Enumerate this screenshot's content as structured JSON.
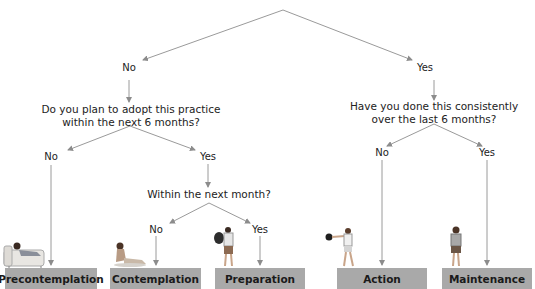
{
  "diagram": {
    "type": "decision-tree",
    "root_branches": {
      "left": "No",
      "right": "Yes"
    },
    "questions": {
      "plan_6_months": "Do you plan to adopt this practice\nwithin the next 6 months?",
      "plan_6_months_line1": "Do you plan to adopt this practice",
      "plan_6_months_line2": "within the next 6 months?",
      "consistent_line1": "Have you done this consistently",
      "consistent_line2": "over the last 6 months?",
      "next_month": "Within the next month?"
    },
    "answers": {
      "plan_no": "No",
      "plan_yes": "Yes",
      "consistent_no": "No",
      "consistent_yes": "Yes",
      "month_no": "No",
      "month_yes": "Yes"
    },
    "stages": [
      {
        "label": "Precontemplation",
        "illustration": "person-lying-on-couch"
      },
      {
        "label": "Contemplation",
        "illustration": "person-sitting-on-floor"
      },
      {
        "label": "Preparation",
        "illustration": "person-carrying-gym-bag"
      },
      {
        "label": "Action",
        "illustration": "person-exercising-with-kettlebell"
      },
      {
        "label": "Maintenance",
        "illustration": "person-with-towel"
      }
    ],
    "colors": {
      "stage_box": "#a9a9a9",
      "arrows": "#9a9a9a",
      "text": "#222222"
    }
  }
}
